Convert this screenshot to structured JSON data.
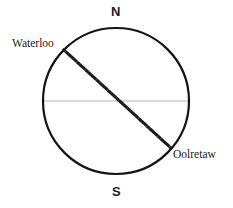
{
  "figure": {
    "type": "antipodal-points-globe-diagram",
    "width": 233,
    "height": 208,
    "background_color": "#ffffff"
  },
  "circle": {
    "name": "earth-cross-section-circle",
    "center_x": 116,
    "center_y": 101,
    "radius": 73,
    "stroke_color": "#141414",
    "stroke_width": 2.2,
    "fill": "none"
  },
  "equator_line": {
    "name": "equator-line",
    "x1": 44,
    "y1": 101,
    "x2": 189,
    "y2": 101,
    "stroke_color": "#b4b4b4",
    "stroke_width": 1
  },
  "diameter_line": {
    "name": "waterloo-oolretaw-diameter",
    "style": "dotted",
    "x1": 64,
    "y1": 50,
    "x2": 172,
    "y2": 149,
    "stroke_color": "#1a1a1a",
    "stroke_width": 3.1,
    "dash_pattern": "0.6 3.2",
    "linecap": "square"
  },
  "labels": {
    "north": "N",
    "south": "S",
    "waterloo": "Waterloo",
    "oolretaw": "Oolretaw"
  }
}
